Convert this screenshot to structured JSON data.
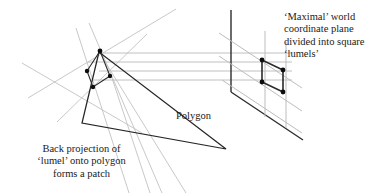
{
  "figure": {
    "width": 380,
    "height": 193,
    "background": "#ffffff"
  },
  "colors": {
    "ink": "#1a1a1a",
    "dark_line": "#262626",
    "grid_line": "#b9b9b9",
    "ray_line": "#c2c2c2",
    "vertex_dot": "#0d0d0d",
    "background": "#ffffff"
  },
  "captions": {
    "plane": {
      "name": "plane-caption",
      "lines": [
        "‘Maximal’ world",
        "coordinate plane",
        "divided into square",
        "‘lumels’"
      ],
      "align": "left"
    },
    "patch": {
      "name": "patch-caption",
      "lines": [
        "Back projection of",
        "‘lumel’ onto polygon",
        "forms a patch"
      ],
      "align": "center"
    },
    "polygon": {
      "name": "polygon-caption",
      "lines": [
        "Polygon"
      ],
      "align": "left"
    }
  },
  "geometry": {
    "polygon": {
      "label": "Polygon",
      "points": "99,52 82,123 225,148",
      "stroke": "#262626",
      "stroke_width": 1.3
    },
    "patch_quad": {
      "label": "back-projected patch",
      "points": "100,51 86,72 93,87 110,76",
      "stroke": "#262626",
      "stroke_width": 1.2,
      "vertices": [
        {
          "x": 100,
          "y": 51
        },
        {
          "x": 86,
          "y": 72
        },
        {
          "x": 93,
          "y": 87
        },
        {
          "x": 110,
          "y": 76
        }
      ]
    },
    "lumel_quad": {
      "label": "lumel",
      "points": "262,60 262,82 283,92 283,70",
      "stroke": "#262626",
      "stroke_width": 1.6,
      "vertices": [
        {
          "x": 262,
          "y": 60
        },
        {
          "x": 262,
          "y": 82
        },
        {
          "x": 283,
          "y": 92
        },
        {
          "x": 283,
          "y": 70
        }
      ]
    },
    "plane_vertical_edge": {
      "x1": 231,
      "y1": 10,
      "x2": 231,
      "y2": 92,
      "stroke": "#262626"
    },
    "plane_bottom_edge": {
      "x1": 231,
      "y1": 92,
      "x2": 302,
      "y2": 139,
      "stroke": "#262626"
    },
    "plane_grid_vertical": [
      {
        "x1": 265,
        "y1": 32,
        "x2": 265,
        "y2": 117
      },
      {
        "x1": 286,
        "y1": 42,
        "x2": 286,
        "y2": 127
      }
    ],
    "plane_grid_diagonal": [
      {
        "x1": 219,
        "y1": 33,
        "x2": 300,
        "y2": 87
      },
      {
        "x1": 219,
        "y1": 55,
        "x2": 300,
        "y2": 109
      },
      {
        "x1": 219,
        "y1": 78,
        "x2": 300,
        "y2": 132
      }
    ],
    "projection_rays": [
      {
        "x1": 100,
        "y1": 53,
        "x2": 290,
        "y2": 53
      },
      {
        "x1": 92,
        "y1": 62,
        "x2": 290,
        "y2": 62
      },
      {
        "x1": 100,
        "y1": 71,
        "x2": 290,
        "y2": 71
      },
      {
        "x1": 95,
        "y1": 80,
        "x2": 290,
        "y2": 80
      }
    ],
    "sight_lines": [
      {
        "x1": 28,
        "y1": 98,
        "x2": 175,
        "y2": 9
      },
      {
        "x1": 22,
        "y1": 62,
        "x2": 140,
        "y2": 131
      },
      {
        "x1": 76,
        "y1": 29,
        "x2": 128,
        "y2": 192
      },
      {
        "x1": 88,
        "y1": 24,
        "x2": 160,
        "y2": 192
      },
      {
        "x1": 58,
        "y1": 120,
        "x2": 145,
        "y2": 36
      }
    ],
    "dot_radius": 2.2
  }
}
